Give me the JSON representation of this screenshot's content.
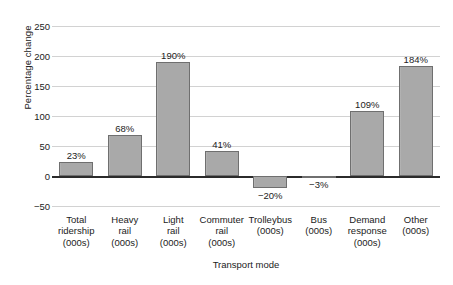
{
  "chart_data": {
    "type": "bar",
    "title": "",
    "subtitle": "",
    "xlabel": "Transport mode",
    "ylabel": "Percentage change",
    "ylim": [
      -50,
      250
    ],
    "yticks": [
      -50,
      0,
      50,
      100,
      150,
      200,
      250
    ],
    "ytick_labels": [
      "−50",
      "0",
      "50",
      "100",
      "150",
      "200",
      "250"
    ],
    "grid": true,
    "legend": false,
    "bar_color": "#a9a9a9",
    "bar_edge_color": "#6f6f6f",
    "categories": [
      "Total ridership (000s)",
      "Heavy rail (000s)",
      "Light rail (000s)",
      "Commuter rail (000s)",
      "Trolleybus (000s)",
      "Bus (000s)",
      "Demand response (000s)",
      "Other (000s)"
    ],
    "category_lines": [
      [
        "Total",
        "ridership",
        "(000s)"
      ],
      [
        "Heavy",
        "rail",
        "(000s)"
      ],
      [
        "Light",
        "rail",
        "(000s)"
      ],
      [
        "Commuter",
        "rail",
        "(000s)"
      ],
      [
        "Trolleybus",
        "(000s)"
      ],
      [
        "Bus",
        "(000s)"
      ],
      [
        "Demand",
        "response",
        "(000s)"
      ],
      [
        "Other",
        "(000s)"
      ]
    ],
    "values": [
      23,
      68,
      190,
      41,
      -20,
      -3,
      109,
      184
    ],
    "value_labels": [
      "23%",
      "68%",
      "190%",
      "41%",
      "−20%",
      "−3%",
      "109%",
      "184%"
    ]
  }
}
